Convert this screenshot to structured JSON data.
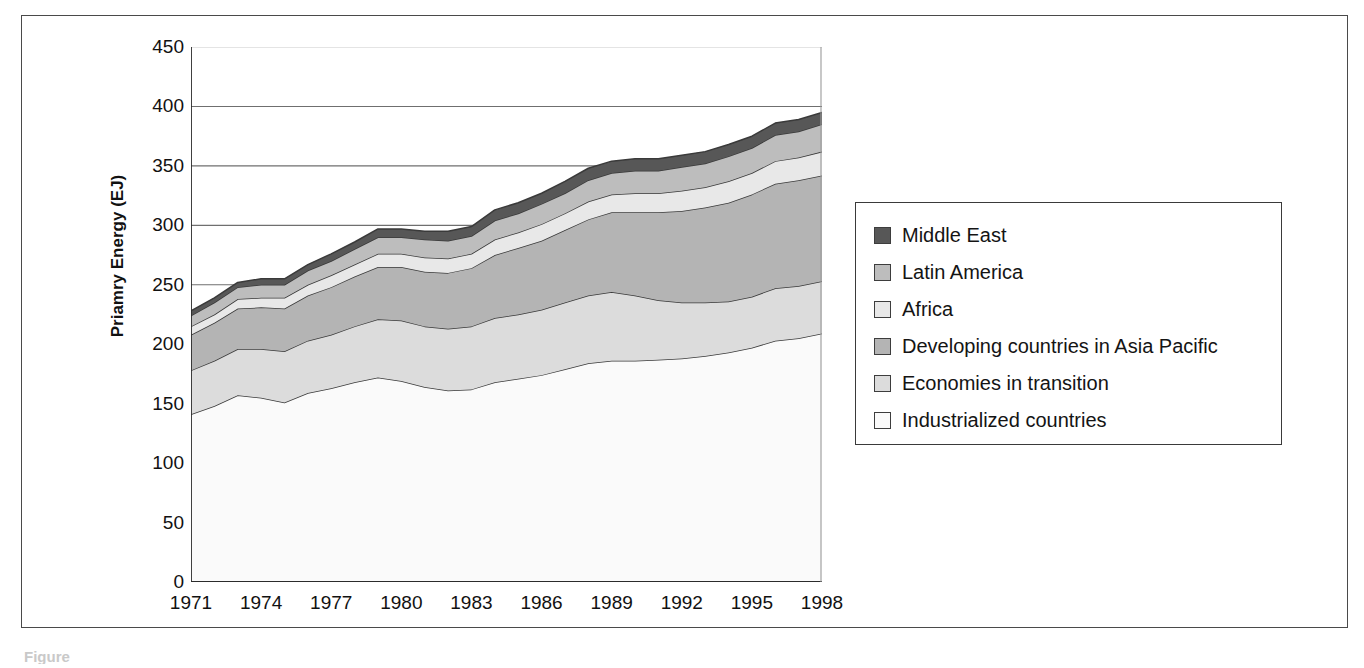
{
  "figure": {
    "caption_fragment": "Figure"
  },
  "chart": {
    "y_axis_title": "Priamry Energy (EJ)",
    "y_ticks": [
      "0",
      "50",
      "100",
      "150",
      "200",
      "250",
      "300",
      "350",
      "400",
      "450"
    ],
    "x_ticks": [
      "1971",
      "1974",
      "1977",
      "1980",
      "1983",
      "1986",
      "1989",
      "1992",
      "1995",
      "1998"
    ],
    "grid": "horizontal",
    "legend_position": "right-outside"
  },
  "legend": {
    "items": [
      {
        "label": "Middle East",
        "color": "#575757"
      },
      {
        "label": "Latin America",
        "color": "#bdbdbd"
      },
      {
        "label": "Africa",
        "color": "#e8e8e8"
      },
      {
        "label": "Developing countries in Asia Pacific",
        "color": "#b4b4b4"
      },
      {
        "label": "Economies in transition",
        "color": "#dcdcdc"
      },
      {
        "label": "Industrialized countries",
        "color": "#fafafa"
      }
    ]
  },
  "chart_data": {
    "type": "area",
    "stacked": true,
    "title": "",
    "xlabel": "",
    "ylabel": "Priamry Energy (EJ)",
    "xlim": [
      1971,
      1998
    ],
    "ylim": [
      0,
      450
    ],
    "yticks": [
      0,
      50,
      100,
      150,
      200,
      250,
      300,
      350,
      400,
      450
    ],
    "xticks": [
      1971,
      1974,
      1977,
      1980,
      1983,
      1986,
      1989,
      1992,
      1995,
      1998
    ],
    "x": [
      1971,
      1972,
      1973,
      1974,
      1975,
      1976,
      1977,
      1978,
      1979,
      1980,
      1981,
      1982,
      1983,
      1984,
      1985,
      1986,
      1987,
      1988,
      1989,
      1990,
      1991,
      1992,
      1993,
      1994,
      1995,
      1996,
      1997,
      1998
    ],
    "stack_order_bottom_to_top": [
      "Industrialized countries",
      "Economies in transition",
      "Developing countries in Asia Pacific",
      "Africa",
      "Latin America",
      "Middle East"
    ],
    "series": [
      {
        "name": "Industrialized countries",
        "color": "#fafafa",
        "values": [
          141,
          148,
          157,
          155,
          151,
          159,
          163,
          168,
          172,
          169,
          164,
          161,
          162,
          168,
          171,
          174,
          179,
          184,
          186,
          186,
          187,
          188,
          190,
          193,
          197,
          203,
          205,
          209
        ]
      },
      {
        "name": "Economies in transition",
        "color": "#dcdcdc",
        "values": [
          37,
          38,
          39,
          41,
          43,
          44,
          45,
          47,
          49,
          51,
          51,
          52,
          53,
          54,
          54,
          55,
          56,
          57,
          58,
          55,
          50,
          47,
          45,
          43,
          43,
          44,
          44,
          44
        ]
      },
      {
        "name": "Developing countries in Asia Pacific",
        "color": "#b4b4b4",
        "values": [
          30,
          32,
          34,
          35,
          36,
          38,
          40,
          42,
          44,
          45,
          46,
          47,
          49,
          53,
          56,
          58,
          61,
          64,
          67,
          70,
          74,
          77,
          80,
          83,
          86,
          88,
          89,
          89
        ]
      },
      {
        "name": "Africa",
        "color": "#e8e8e8",
        "values": [
          7,
          7,
          8,
          8,
          9,
          9,
          10,
          10,
          11,
          11,
          12,
          12,
          12,
          13,
          13,
          14,
          14,
          15,
          15,
          16,
          16,
          17,
          17,
          18,
          18,
          19,
          19,
          20
        ]
      },
      {
        "name": "Latin America",
        "color": "#bdbdbd",
        "values": [
          9,
          10,
          10,
          11,
          11,
          12,
          12,
          13,
          14,
          14,
          15,
          15,
          15,
          16,
          16,
          17,
          17,
          18,
          18,
          19,
          19,
          20,
          20,
          21,
          21,
          22,
          22,
          23
        ]
      },
      {
        "name": "Middle East",
        "color": "#575757",
        "values": [
          4,
          4,
          4,
          5,
          5,
          5,
          6,
          6,
          7,
          7,
          7,
          8,
          8,
          9,
          9,
          9,
          10,
          10,
          10,
          10,
          10,
          10,
          10,
          10,
          10,
          10,
          10,
          10
        ]
      }
    ],
    "totals": [
      228,
      239,
      252,
      255,
      255,
      267,
      276,
      286,
      297,
      297,
      295,
      295,
      299,
      313,
      319,
      327,
      337,
      348,
      354,
      356,
      356,
      359,
      362,
      368,
      375,
      386,
      389,
      395
    ]
  }
}
